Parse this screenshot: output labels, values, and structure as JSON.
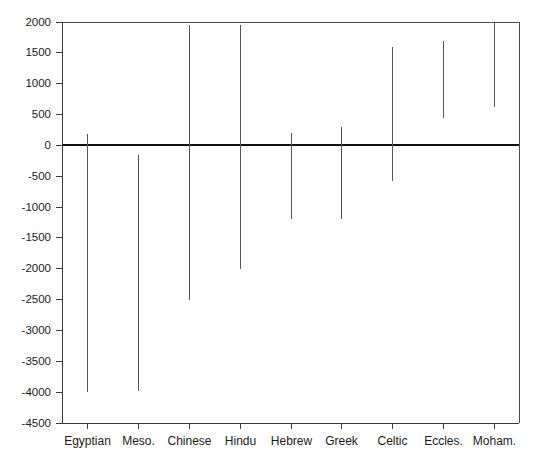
{
  "chart_data": {
    "type": "bar",
    "title": "",
    "subtitle": "",
    "xlabel": "",
    "ylabel": "",
    "orientation": "vertical",
    "bar_style": "range-line",
    "grid": false,
    "legend": null,
    "ylim": [
      -4500,
      2000
    ],
    "ytick_step": 500,
    "yticks": [
      2000,
      1500,
      1000,
      500,
      0,
      -500,
      -1000,
      -1500,
      -2000,
      -2500,
      -3000,
      -3500,
      -4000,
      -4500
    ],
    "ytick_labels": [
      "2000",
      "1500",
      "1000",
      "500",
      "0",
      "-500",
      "-1000",
      "-1500",
      "-2000",
      "-2500",
      "-3000",
      "-3500",
      "-4000",
      "-4500"
    ],
    "categories": [
      "Egyptian",
      "Meso.",
      "Chinese",
      "Hindu",
      "Hebrew",
      "Greek",
      "Celtic",
      "Eccles.",
      "Moham."
    ],
    "series": [
      {
        "name": "span",
        "kind": "range",
        "high": [
          180,
          -150,
          1950,
          1950,
          200,
          300,
          1600,
          1700,
          1980
        ],
        "low": [
          -4000,
          -3980,
          -2500,
          -2000,
          -1200,
          -1200,
          -570,
          440,
          620
        ]
      }
    ],
    "zero_reference": 0,
    "colors": {
      "bar": "#555555",
      "axis": "#3a3a3a",
      "zero_line": "#111111",
      "frame": "#4a4a4a",
      "text": "#1a1a1a",
      "background": "#ffffff"
    },
    "geometry": {
      "plot_left": 62,
      "plot_right": 519,
      "plot_top": 22,
      "plot_bottom": 423,
      "zero_y": 145
    }
  }
}
